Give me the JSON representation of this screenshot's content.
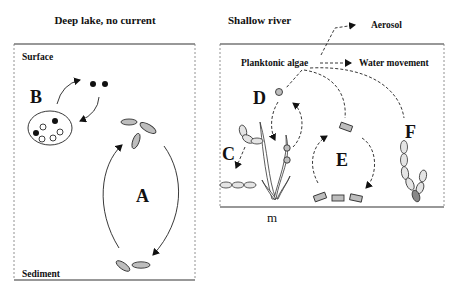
{
  "panels": {
    "left": {
      "title": "Deep lake, no current",
      "top_label": "Surface",
      "bottom_label": "Sediment",
      "process_labels": {
        "a": "A",
        "b": "B"
      }
    },
    "right": {
      "title": "Shallow river",
      "source_label": "Planktonic algae",
      "aerosol_label": "Aerosol",
      "water_label": "Water movement",
      "process_labels": {
        "c": "C",
        "d": "D",
        "e": "E",
        "f": "F"
      },
      "bottom_label": "m"
    }
  }
}
